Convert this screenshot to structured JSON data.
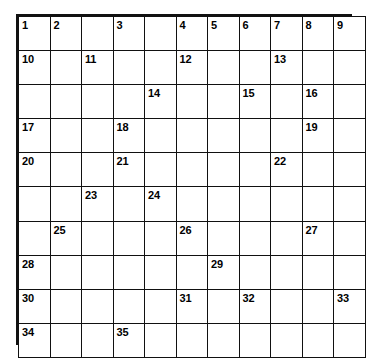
{
  "puzzle": {
    "type": "crossword-grid",
    "rows": 10,
    "columns": 11,
    "colors": {
      "grid_line": "#111111",
      "cell_background": "#ffffff",
      "blocked_fill": "#2b2b2b",
      "number_color": "#000000"
    },
    "legend": {
      "blocked_cell_name": "shaded-block",
      "open_cell_name": "open-cell"
    },
    "numbers_visible": [
      "1",
      "2",
      "3",
      "4",
      "5",
      "6",
      "7",
      "8",
      "9",
      "10",
      "11",
      "12",
      "13",
      "14",
      "15",
      "16",
      "17",
      "18",
      "19",
      "20",
      "21",
      "22",
      "23",
      "24",
      "25",
      "26",
      "27",
      "28",
      "29",
      "30",
      "31",
      "32",
      "33",
      "34",
      "35"
    ],
    "cells": [
      [
        {
          "n": "1",
          "blocked": false
        },
        {
          "n": "2",
          "blocked": false
        },
        {
          "n": "",
          "blocked": true
        },
        {
          "n": "3",
          "blocked": false
        },
        {
          "n": "",
          "blocked": false
        },
        {
          "n": "4",
          "blocked": false
        },
        {
          "n": "5",
          "blocked": false
        },
        {
          "n": "6",
          "blocked": false
        },
        {
          "n": "7",
          "blocked": false
        },
        {
          "n": "8",
          "blocked": false
        },
        {
          "n": "9",
          "blocked": false
        }
      ],
      [
        {
          "n": "10",
          "blocked": false
        },
        {
          "n": "",
          "blocked": false
        },
        {
          "n": "11",
          "blocked": false
        },
        {
          "n": "",
          "blocked": false
        },
        {
          "n": "",
          "blocked": true
        },
        {
          "n": "12",
          "blocked": false
        },
        {
          "n": "",
          "blocked": false
        },
        {
          "n": "",
          "blocked": true
        },
        {
          "n": "13",
          "blocked": false
        },
        {
          "n": "",
          "blocked": false
        },
        {
          "n": "",
          "blocked": false
        }
      ],
      [
        {
          "n": "",
          "blocked": false
        },
        {
          "n": "",
          "blocked": false
        },
        {
          "n": "",
          "blocked": false
        },
        {
          "n": "",
          "blocked": true
        },
        {
          "n": "14",
          "blocked": false
        },
        {
          "n": "",
          "blocked": false
        },
        {
          "n": "",
          "blocked": false
        },
        {
          "n": "15",
          "blocked": false
        },
        {
          "n": "",
          "blocked": true
        },
        {
          "n": "16",
          "blocked": false
        },
        {
          "n": "",
          "blocked": false
        }
      ],
      [
        {
          "n": "17",
          "blocked": false
        },
        {
          "n": "",
          "blocked": false
        },
        {
          "n": "",
          "blocked": false
        },
        {
          "n": "18",
          "blocked": false
        },
        {
          "n": "",
          "blocked": false
        },
        {
          "n": "",
          "blocked": false
        },
        {
          "n": "",
          "blocked": false
        },
        {
          "n": "",
          "blocked": false
        },
        {
          "n": "",
          "blocked": true
        },
        {
          "n": "19",
          "blocked": false
        },
        {
          "n": "",
          "blocked": false
        }
      ],
      [
        {
          "n": "20",
          "blocked": false
        },
        {
          "n": "",
          "blocked": false
        },
        {
          "n": "",
          "blocked": true
        },
        {
          "n": "21",
          "blocked": false
        },
        {
          "n": "",
          "blocked": false
        },
        {
          "n": "",
          "blocked": false
        },
        {
          "n": "",
          "blocked": false
        },
        {
          "n": "",
          "blocked": false
        },
        {
          "n": "22",
          "blocked": false
        },
        {
          "n": "",
          "blocked": false
        },
        {
          "n": "",
          "blocked": false
        }
      ],
      [
        {
          "n": "",
          "blocked": false
        },
        {
          "n": "",
          "blocked": false
        },
        {
          "n": "23",
          "blocked": false
        },
        {
          "n": "",
          "blocked": true
        },
        {
          "n": "24",
          "blocked": false
        },
        {
          "n": "",
          "blocked": false
        },
        {
          "n": "",
          "blocked": false
        },
        {
          "n": "",
          "blocked": false
        },
        {
          "n": "",
          "blocked": false
        },
        {
          "n": "",
          "blocked": true
        },
        {
          "n": "",
          "blocked": false
        }
      ],
      [
        {
          "n": "",
          "blocked": true
        },
        {
          "n": "25",
          "blocked": false
        },
        {
          "n": "",
          "blocked": false
        },
        {
          "n": "",
          "blocked": false
        },
        {
          "n": "",
          "blocked": true
        },
        {
          "n": "26",
          "blocked": false
        },
        {
          "n": "",
          "blocked": false
        },
        {
          "n": "",
          "blocked": false
        },
        {
          "n": "",
          "blocked": false
        },
        {
          "n": "27",
          "blocked": false
        },
        {
          "n": "",
          "blocked": false
        }
      ],
      [
        {
          "n": "28",
          "blocked": false
        },
        {
          "n": "",
          "blocked": false
        },
        {
          "n": "",
          "blocked": false
        },
        {
          "n": "",
          "blocked": false
        },
        {
          "n": "",
          "blocked": false
        },
        {
          "n": "",
          "blocked": true
        },
        {
          "n": "29",
          "blocked": false
        },
        {
          "n": "",
          "blocked": false
        },
        {
          "n": "",
          "blocked": false
        },
        {
          "n": "",
          "blocked": false
        },
        {
          "n": "",
          "blocked": true
        }
      ],
      [
        {
          "n": "30",
          "blocked": false
        },
        {
          "n": "",
          "blocked": false
        },
        {
          "n": "",
          "blocked": false
        },
        {
          "n": "",
          "blocked": false
        },
        {
          "n": "",
          "blocked": true
        },
        {
          "n": "31",
          "blocked": false
        },
        {
          "n": "",
          "blocked": true
        },
        {
          "n": "32",
          "blocked": false
        },
        {
          "n": "",
          "blocked": false
        },
        {
          "n": "",
          "blocked": false
        },
        {
          "n": "33",
          "blocked": false
        }
      ],
      [
        {
          "n": "34",
          "blocked": false
        },
        {
          "n": "",
          "blocked": false
        },
        {
          "n": "",
          "blocked": true
        },
        {
          "n": "35",
          "blocked": false
        },
        {
          "n": "",
          "blocked": false
        },
        {
          "n": "",
          "blocked": false
        },
        {
          "n": "",
          "blocked": false
        },
        {
          "n": "",
          "blocked": false
        },
        {
          "n": "",
          "blocked": false
        },
        {
          "n": "",
          "blocked": false
        },
        {
          "n": "",
          "blocked": false
        }
      ]
    ]
  }
}
